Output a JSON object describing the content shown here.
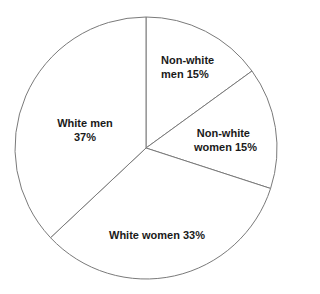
{
  "chart_data": {
    "type": "pie",
    "title": "",
    "categories": [
      "Non-white men",
      "Non-white women",
      "White women",
      "White men"
    ],
    "values": [
      15,
      15,
      33,
      37
    ],
    "unit": "%",
    "start_angle_deg": 90,
    "direction": "clockwise",
    "legend": "none",
    "labels": [
      {
        "line1": "Non-white",
        "line2": "men 15%"
      },
      {
        "line1": "Non-white",
        "line2": "women 15%"
      },
      {
        "line1": "White women 33%",
        "line2": ""
      },
      {
        "line1": "White men",
        "line2": "37%"
      }
    ],
    "style": {
      "fill": "#ffffff",
      "stroke": "#7a7a7a",
      "text_color": "#1a1a1a"
    },
    "geometry": {
      "cx": 146,
      "cy": 148,
      "r": 131
    }
  }
}
